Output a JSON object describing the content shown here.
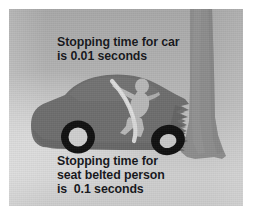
{
  "figure": {
    "plate": {
      "background_top_color": "#a9a9a9",
      "background_bottom_color": "#cccccc",
      "border_color": "#ffffff"
    }
  },
  "captions": {
    "car": {
      "text": "Stopping time for car\nis 0.01 seconds",
      "lines": [
        "Stopping time for car",
        "is 0.01 seconds"
      ],
      "quantity": "0.01",
      "unit": "seconds",
      "color": "#15161a"
    },
    "person": {
      "text": "Stopping time for\nseat belted person\nis  0.1 seconds",
      "lines": [
        "Stopping time for",
        "seat belted person",
        "is  0.1 seconds"
      ],
      "quantity": "0.1",
      "unit": "seconds",
      "color": "#15161a"
    }
  },
  "scene": {
    "objects": [
      {
        "name": "tree-trunk",
        "color": "#8d8d8d"
      },
      {
        "name": "car-body",
        "color": "#6e6e6e"
      },
      {
        "name": "car-crumple-zone",
        "color": "#6e6e6e"
      },
      {
        "name": "rear-wheel",
        "color": "#111111"
      },
      {
        "name": "front-wheel",
        "color": "#111111"
      },
      {
        "name": "seat-belted-person",
        "color": "#b8b8b8"
      },
      {
        "name": "seat-belt-strap",
        "color": "#d8d8d8"
      }
    ]
  }
}
